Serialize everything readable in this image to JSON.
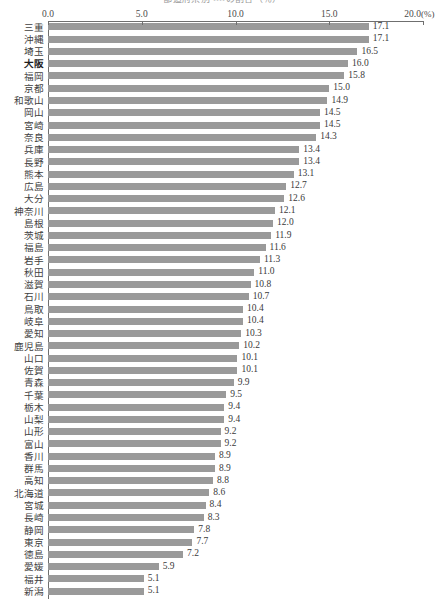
{
  "title": "都道府県別 ・・・・の割合（％）",
  "axis": {
    "unit": "(%)",
    "ticks": [
      "0.0",
      "5.0",
      "10.0",
      "15.0",
      "20.0"
    ],
    "tick_values": [
      0,
      5,
      10,
      15,
      20
    ],
    "xmin": 0,
    "xmax": 20
  },
  "highlight_category": "大阪",
  "colors": {
    "bar": "#9a9a9a",
    "axis": "#6f6f6f",
    "text": "#3a3a3a"
  },
  "chart_data": {
    "type": "bar",
    "orientation": "horizontal",
    "title": "都道府県別 ・・・・の割合（％）",
    "xlabel": "(%)",
    "ylabel": "",
    "xlim": [
      0,
      20
    ],
    "grid": false,
    "legend": "none",
    "categories": [
      "三重",
      "沖縄",
      "埼玉",
      "大阪",
      "福岡",
      "京都",
      "和歌山",
      "岡山",
      "宮崎",
      "奈良",
      "兵庫",
      "長野",
      "熊本",
      "広島",
      "大分",
      "神奈川",
      "島根",
      "茨城",
      "福島",
      "岩手",
      "秋田",
      "滋賀",
      "石川",
      "鳥取",
      "岐阜",
      "愛知",
      "鹿児島",
      "山口",
      "佐賀",
      "青森",
      "千葉",
      "栃木",
      "山梨",
      "山形",
      "富山",
      "香川",
      "群馬",
      "高知",
      "北海道",
      "宮城",
      "長崎",
      "静岡",
      "東京",
      "徳島",
      "愛媛",
      "福井",
      "新潟"
    ],
    "values": [
      17.1,
      17.1,
      16.5,
      16.0,
      15.8,
      15.0,
      14.9,
      14.5,
      14.5,
      14.3,
      13.4,
      13.4,
      13.1,
      12.7,
      12.6,
      12.1,
      12.0,
      11.9,
      11.6,
      11.3,
      11.0,
      10.8,
      10.7,
      10.4,
      10.4,
      10.3,
      10.2,
      10.1,
      10.1,
      9.9,
      9.5,
      9.4,
      9.4,
      9.2,
      9.2,
      8.9,
      8.9,
      8.8,
      8.6,
      8.4,
      8.3,
      7.8,
      7.7,
      7.2,
      5.9,
      5.1,
      5.1
    ],
    "value_labels": [
      "17.1",
      "17.1",
      "16.5",
      "16.0",
      "15.8",
      "15.0",
      "14.9",
      "14.5",
      "14.5",
      "14.3",
      "13.4",
      "13.4",
      "13.1",
      "12.7",
      "12.6",
      "12.1",
      "12.0",
      "11.9",
      "11.6",
      "11.3",
      "11.0",
      "10.8",
      "10.7",
      "10.4",
      "10.4",
      "10.3",
      "10.2",
      "10.1",
      "10.1",
      "9.9",
      "9.5",
      "9.4",
      "9.4",
      "9.2",
      "9.2",
      "8.9",
      "8.9",
      "8.8",
      "8.6",
      "8.4",
      "8.3",
      "7.8",
      "7.7",
      "7.2",
      "5.9",
      "5.1",
      "5.1"
    ]
  }
}
